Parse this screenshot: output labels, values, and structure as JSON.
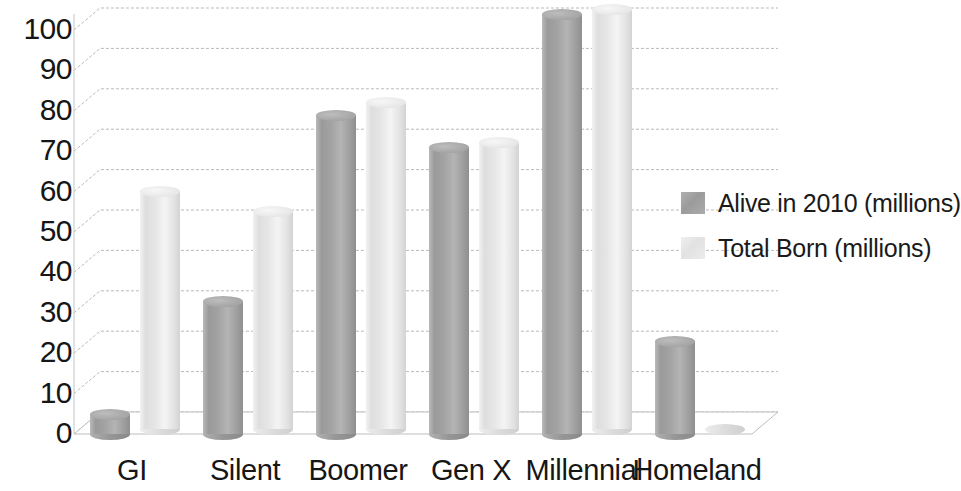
{
  "chart_data": {
    "type": "bar",
    "title": "",
    "subtitle": "",
    "xlabel": "",
    "ylabel": "",
    "categories": [
      "GI",
      "Silent",
      "Boomer",
      "Gen X",
      "Millennial",
      "Homeland"
    ],
    "series": [
      {
        "name": "Alive in 2010 (millions)",
        "color": "#a0a0a0",
        "values": [
          5,
          33,
          79,
          71,
          104,
          23
        ]
      },
      {
        "name": "Total Born (millions)",
        "color": "#e8e8e8",
        "values": [
          59,
          54,
          81,
          71,
          104,
          1
        ]
      }
    ],
    "ylim": [
      0,
      100
    ],
    "yticks": [
      0,
      10,
      20,
      30,
      40,
      50,
      60,
      70,
      80,
      90,
      100
    ],
    "ytick_labels": [
      "0",
      "10",
      "20",
      "30",
      "40",
      "50",
      "60",
      "70",
      "80",
      "90",
      "100"
    ],
    "grid": true,
    "grid_axis": "y",
    "legend_position": "right",
    "style": "3d-cylinder",
    "annotations": []
  },
  "legend": {
    "entries": [
      {
        "label": "Alive in 2010 (millions)",
        "swatch": "dark"
      },
      {
        "label": "Total Born (millions)",
        "swatch": "light"
      }
    ]
  }
}
